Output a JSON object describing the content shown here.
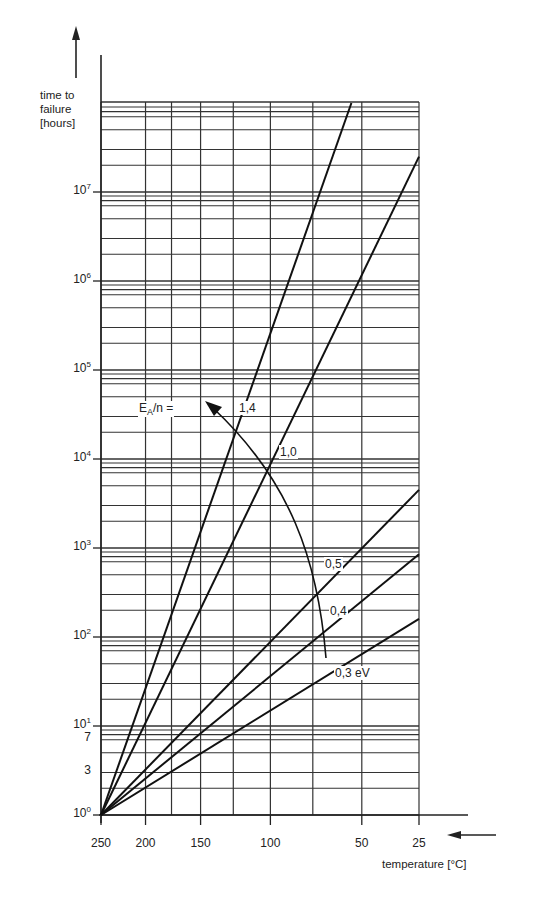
{
  "chart_data": {
    "type": "line",
    "title": "",
    "ylabel": "time to failure [hours]",
    "xlabel": "temperature [°C]",
    "yscale": "log",
    "ylim": [
      1,
      100000000
    ],
    "xscale": "reciprocal-absolute-temperature",
    "xlim": [
      250,
      25
    ],
    "grid": true,
    "y_ticks": [
      {
        "value": 1,
        "label": "10",
        "exp": "0"
      },
      {
        "value": 3,
        "label": "3",
        "exp": ""
      },
      {
        "value": 7,
        "label": "7",
        "exp": ""
      },
      {
        "value": 10,
        "label": "10",
        "exp": "1"
      },
      {
        "value": 100,
        "label": "10",
        "exp": "2"
      },
      {
        "value": 1000,
        "label": "10",
        "exp": "3"
      },
      {
        "value": 10000,
        "label": "10",
        "exp": "4"
      },
      {
        "value": 100000,
        "label": "10",
        "exp": "5"
      },
      {
        "value": 1000000,
        "label": "10",
        "exp": "6"
      },
      {
        "value": 10000000,
        "label": "10",
        "exp": "7"
      }
    ],
    "y_grid_multipliers": [
      1,
      2,
      3,
      5,
      7,
      8,
      9
    ],
    "x_ticks": [
      250,
      200,
      150,
      100,
      50,
      25
    ],
    "x_grid": [
      250,
      200,
      175,
      150,
      125,
      100,
      75,
      50,
      25
    ],
    "series": [
      {
        "name": "1,4",
        "ea_ev": 1.4,
        "points": [
          {
            "x": 250,
            "y": 1
          },
          {
            "x": 55,
            "y": 100000000
          }
        ]
      },
      {
        "name": "1,0",
        "ea_ev": 1.0,
        "points": [
          {
            "x": 250,
            "y": 1
          },
          {
            "x": 25,
            "y": 25000000
          }
        ]
      },
      {
        "name": "0,5",
        "ea_ev": 0.5,
        "points": [
          {
            "x": 250,
            "y": 1
          },
          {
            "x": 25,
            "y": 4500
          }
        ]
      },
      {
        "name": "0,4",
        "ea_ev": 0.4,
        "points": [
          {
            "x": 250,
            "y": 1
          },
          {
            "x": 25,
            "y": 850
          }
        ]
      },
      {
        "name": "0,3 eV",
        "ea_ev": 0.3,
        "points": [
          {
            "x": 250,
            "y": 1
          },
          {
            "x": 25,
            "y": 160
          }
        ]
      }
    ],
    "annotations": {
      "ea_label": "E",
      "ea_sub": "A",
      "ea_rest": "/n =",
      "arrow": "curved arrow from 0,4 label region up to E_A/n label"
    }
  },
  "labels": {
    "ylabel_line1": "time to",
    "ylabel_line2": "failure",
    "ylabel_line3": "[hours]",
    "xlabel": "temperature [°C]",
    "ea_label_main": "E",
    "ea_label_sub": "A",
    "ea_label_rest": "/n ="
  }
}
